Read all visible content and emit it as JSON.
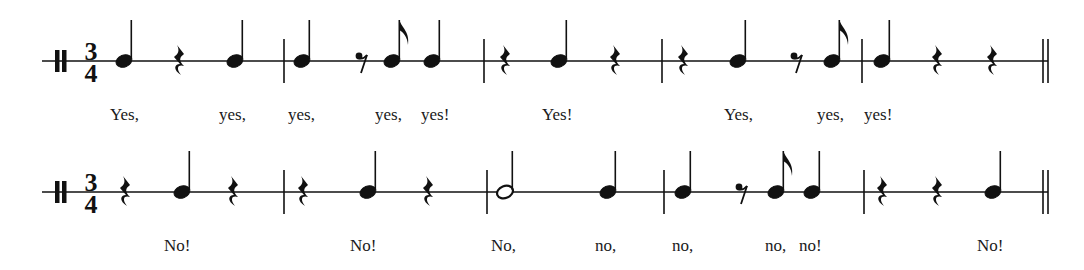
{
  "score": {
    "ink_color": "#111111",
    "time_signature": {
      "top": "3",
      "bottom": "4"
    },
    "clef": "percussion-clef",
    "lines": [
      {
        "id": "yes-line",
        "staff_y": 61,
        "staff_x_start": 42,
        "staff_x_end": 1048,
        "clef_x": 55,
        "timesig_x": 91,
        "lyric_baseline_y": 120,
        "events": [
          {
            "type": "quarter",
            "x": 124
          },
          {
            "type": "quarter-rest",
            "x": 179
          },
          {
            "type": "quarter",
            "x": 235
          },
          {
            "type": "barline",
            "x": 284
          },
          {
            "type": "quarter",
            "x": 302
          },
          {
            "type": "eighth-rest",
            "x": 362
          },
          {
            "type": "eighth",
            "x": 392
          },
          {
            "type": "quarter",
            "x": 432
          },
          {
            "type": "barline",
            "x": 484
          },
          {
            "type": "quarter-rest",
            "x": 505
          },
          {
            "type": "quarter",
            "x": 559
          },
          {
            "type": "quarter-rest",
            "x": 615
          },
          {
            "type": "barline",
            "x": 662
          },
          {
            "type": "quarter-rest",
            "x": 683
          },
          {
            "type": "quarter",
            "x": 738
          },
          {
            "type": "eighth-rest",
            "x": 797
          },
          {
            "type": "eighth",
            "x": 832
          },
          {
            "type": "barline",
            "x": 862
          },
          {
            "type": "quarter",
            "x": 882
          },
          {
            "type": "quarter-rest",
            "x": 937
          },
          {
            "type": "quarter-rest",
            "x": 992
          },
          {
            "type": "final-barline",
            "x": 1043
          }
        ],
        "lyrics": [
          {
            "text": "Yes,",
            "x": 110
          },
          {
            "text": "yes,",
            "x": 219
          },
          {
            "text": "yes,",
            "x": 288
          },
          {
            "text": "yes,",
            "x": 375
          },
          {
            "text": "yes!",
            "x": 421
          },
          {
            "text": "Yes!",
            "x": 542
          },
          {
            "text": "Yes,",
            "x": 724
          },
          {
            "text": "yes,",
            "x": 817
          },
          {
            "text": "yes!",
            "x": 864
          }
        ]
      },
      {
        "id": "no-line",
        "staff_y": 192,
        "staff_x_start": 42,
        "staff_x_end": 1048,
        "clef_x": 55,
        "timesig_x": 91,
        "lyric_baseline_y": 251,
        "events": [
          {
            "type": "quarter-rest",
            "x": 125
          },
          {
            "type": "quarter",
            "x": 182
          },
          {
            "type": "quarter-rest",
            "x": 233
          },
          {
            "type": "barline",
            "x": 284
          },
          {
            "type": "quarter-rest",
            "x": 303
          },
          {
            "type": "quarter",
            "x": 368
          },
          {
            "type": "quarter-rest",
            "x": 428
          },
          {
            "type": "barline",
            "x": 487
          },
          {
            "type": "half",
            "x": 505
          },
          {
            "type": "quarter",
            "x": 608
          },
          {
            "type": "barline",
            "x": 664
          },
          {
            "type": "quarter",
            "x": 683
          },
          {
            "type": "eighth-rest",
            "x": 742
          },
          {
            "type": "eighth",
            "x": 776
          },
          {
            "type": "quarter",
            "x": 812
          },
          {
            "type": "barline",
            "x": 864
          },
          {
            "type": "quarter-rest",
            "x": 882
          },
          {
            "type": "quarter-rest",
            "x": 937
          },
          {
            "type": "quarter",
            "x": 993
          },
          {
            "type": "final-barline",
            "x": 1043
          }
        ],
        "lyrics": [
          {
            "text": "No!",
            "x": 164
          },
          {
            "text": "No!",
            "x": 350
          },
          {
            "text": "No,",
            "x": 491
          },
          {
            "text": "no,",
            "x": 595
          },
          {
            "text": "no,",
            "x": 672
          },
          {
            "text": "no,",
            "x": 765
          },
          {
            "text": "no!",
            "x": 799
          },
          {
            "text": "No!",
            "x": 977
          }
        ]
      }
    ]
  }
}
